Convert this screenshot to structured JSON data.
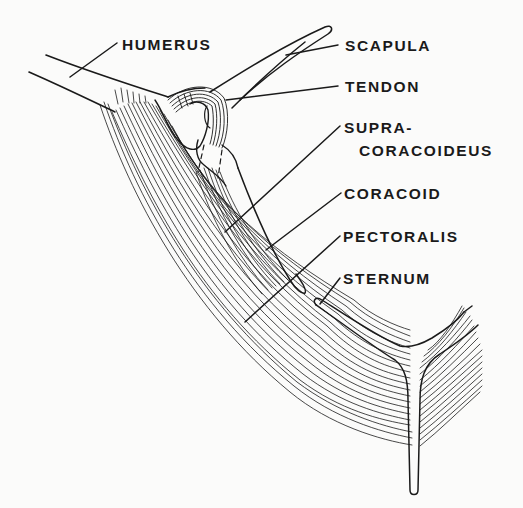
{
  "diagram": {
    "type": "anatomical-illustration",
    "colors": {
      "ink": "#1a1a1a",
      "paper": "#fbfbfa"
    },
    "labels": [
      {
        "id": "humerus",
        "text": "HUMERUS"
      },
      {
        "id": "scapula",
        "text": "SCAPULA"
      },
      {
        "id": "tendon",
        "text": "TENDON"
      },
      {
        "id": "supracoracoideus_line1",
        "text": "SUPRA-"
      },
      {
        "id": "supracoracoideus_line2",
        "text": "CORACOIDEUS"
      },
      {
        "id": "coracoid",
        "text": "CORACOID"
      },
      {
        "id": "pectoralis",
        "text": "PECTORALIS"
      },
      {
        "id": "sternum",
        "text": "STERNUM"
      }
    ]
  }
}
